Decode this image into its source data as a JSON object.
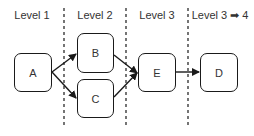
{
  "levels": [
    {
      "label": "Level 1",
      "x": 32
    },
    {
      "label": "Level 2",
      "x": 95
    },
    {
      "label": "Level 3",
      "x": 157
    },
    {
      "label": "Level 3 ➡ 4",
      "x": 220
    }
  ],
  "dividers": [
    64,
    126,
    188
  ],
  "nodes": {
    "A": {
      "label": "A",
      "x": 14,
      "y": 53,
      "w": 38,
      "h": 39
    },
    "B": {
      "label": "B",
      "x": 77,
      "y": 33,
      "w": 37,
      "h": 40
    },
    "C": {
      "label": "C",
      "x": 77,
      "y": 79,
      "w": 37,
      "h": 39
    },
    "E": {
      "label": "E",
      "x": 138,
      "y": 53,
      "w": 38,
      "h": 39
    },
    "D": {
      "label": "D",
      "x": 200,
      "y": 53,
      "w": 38,
      "h": 39
    }
  },
  "edges": [
    {
      "from": "A",
      "to": "B"
    },
    {
      "from": "A",
      "to": "C"
    },
    {
      "from": "B",
      "to": "E"
    },
    {
      "from": "C",
      "to": "E"
    },
    {
      "from": "E",
      "to": "D"
    }
  ],
  "colors": {
    "stroke": "#1a1a1a",
    "text": "#333333",
    "background": "#ffffff"
  }
}
